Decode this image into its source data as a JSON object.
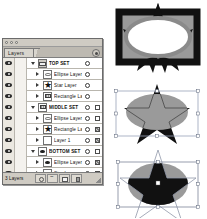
{
  "app": {
    "panel_title": "Layers",
    "panel_menu_icon": "panel-menu-icon"
  },
  "layers_panel": {
    "tab_label": "Layers",
    "footer": {
      "layers_count_label": "3 Layers",
      "buttons": [
        {
          "name": "add-mask-button",
          "icon": "mask-icon"
        },
        {
          "name": "add-style-button",
          "icon": "fx-icon"
        },
        {
          "name": "new-layer-button",
          "icon": "new-layer-icon"
        },
        {
          "name": "delete-layer-button",
          "icon": "trash-icon"
        }
      ]
    },
    "columns": {
      "visibility": "eye-icon",
      "lock": "lock-column",
      "target": "target-ring-icon",
      "style": "appearance-swatch"
    },
    "rows": [
      {
        "label": "TOP SET",
        "kind": "set",
        "indent": 0,
        "expanded": true,
        "visible": true,
        "thumb": "th-set",
        "target": true,
        "style": "none"
      },
      {
        "label": "Ellipse Layer",
        "kind": "layer",
        "indent": 1,
        "expanded": false,
        "visible": true,
        "thumb": "th-ellipse",
        "target": true,
        "style": "none"
      },
      {
        "label": "Star Layer",
        "kind": "layer",
        "indent": 1,
        "expanded": false,
        "visible": true,
        "thumb": "th-star",
        "target": true,
        "style": "none"
      },
      {
        "label": "Rectangle La...",
        "kind": "layer",
        "indent": 1,
        "expanded": false,
        "visible": true,
        "thumb": "th-rect-hatch",
        "target": true,
        "style": "none"
      },
      {
        "label": "MIDDLE SET",
        "kind": "set",
        "indent": 0,
        "expanded": true,
        "visible": true,
        "thumb": "th-rect-hatch",
        "target": true,
        "style": "empty"
      },
      {
        "label": "Ellipse Layer",
        "kind": "layer",
        "indent": 1,
        "expanded": false,
        "visible": true,
        "thumb": "th-ellipse",
        "target": true,
        "style": "empty"
      },
      {
        "label": "Rectangle La...",
        "kind": "layer",
        "indent": 1,
        "expanded": false,
        "visible": true,
        "thumb": "th-star",
        "target": true,
        "style": "grad"
      },
      {
        "label": "Layer 1",
        "kind": "layer",
        "indent": 1,
        "expanded": false,
        "visible": true,
        "thumb": "th-blank",
        "target": true,
        "style": "grad"
      },
      {
        "label": "BOTTOM SET",
        "kind": "set",
        "indent": 0,
        "expanded": true,
        "visible": true,
        "thumb": "th-ellipse-solid",
        "target": true,
        "style": "empty"
      },
      {
        "label": "Ellipse Layer",
        "kind": "layer",
        "indent": 1,
        "expanded": false,
        "visible": true,
        "thumb": "th-ellipse-solid",
        "target": true,
        "style": "grad"
      },
      {
        "label": "Star Layer",
        "kind": "layer",
        "indent": 1,
        "expanded": false,
        "visible": true,
        "thumb": "th-blank",
        "target": true,
        "style": "dark"
      },
      {
        "label": "Rectangle La...",
        "kind": "layer",
        "indent": 1,
        "expanded": false,
        "visible": true,
        "thumb": "th-blank",
        "target": true,
        "style": "empty"
      }
    ]
  },
  "artwork": {
    "colors": {
      "black": "#111111",
      "gray": "#9a9a9a",
      "light_gray": "#c8c8c8",
      "white": "#ffffff",
      "selection_blue": "#9aa4b8"
    },
    "previews": [
      {
        "name": "artwork-top-set",
        "caption": "TOP SET result",
        "shapes": [
          "black-framed-rectangle",
          "black-star-behind",
          "gray-outlined-white-ellipse"
        ]
      },
      {
        "name": "artwork-middle-set",
        "caption": "MIDDLE SET result",
        "shapes": [
          "gray-ellipse",
          "black-star-clipped",
          "thin-rectangle-outline",
          "selection-handles"
        ]
      },
      {
        "name": "artwork-bottom-set",
        "caption": "BOTTOM SET result",
        "shapes": [
          "gray-ellipse",
          "black-star-clipped-to-ellipse",
          "star-path-outline",
          "bounding-box",
          "selection-handles"
        ]
      }
    ]
  }
}
